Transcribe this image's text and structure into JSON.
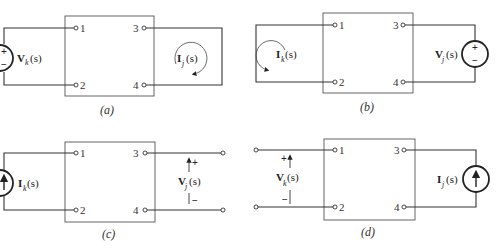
{
  "figure": {
    "panels": [
      {
        "id": "a",
        "caption": "(a)",
        "terminals": [
          "1",
          "2",
          "3",
          "4"
        ],
        "source": {
          "type": "voltage-source",
          "label_main": "V",
          "label_sub": "k",
          "label_arg": "(s)",
          "polarity": [
            "+",
            "−"
          ],
          "side": "left"
        },
        "response": {
          "type": "loop-current",
          "label_main": "I",
          "label_sub": "j",
          "label_arg": "(s)",
          "direction": "clockwise",
          "side": "right"
        }
      },
      {
        "id": "b",
        "caption": "(b)",
        "terminals": [
          "1",
          "2",
          "3",
          "4"
        ],
        "source": {
          "type": "voltage-source",
          "label_main": "V",
          "label_sub": "j",
          "label_arg": "(s)",
          "polarity": [
            "+",
            "−"
          ],
          "side": "right"
        },
        "response": {
          "type": "loop-current",
          "label_main": "I",
          "label_sub": "k",
          "label_arg": "(s)",
          "direction": "counterclockwise",
          "side": "left"
        }
      },
      {
        "id": "c",
        "caption": "(c)",
        "terminals": [
          "1",
          "2",
          "3",
          "4"
        ],
        "source": {
          "type": "current-source",
          "label_main": "I",
          "label_sub": "k",
          "label_arg": "(s)",
          "side": "left"
        },
        "response": {
          "type": "open-circuit-voltage",
          "label_main": "V",
          "label_sub": "j",
          "label_arg": "(s)",
          "polarity": [
            "+",
            "−"
          ],
          "side": "right"
        }
      },
      {
        "id": "d",
        "caption": "(d)",
        "terminals": [
          "1",
          "2",
          "3",
          "4"
        ],
        "source": {
          "type": "current-source",
          "label_main": "I",
          "label_sub": "j",
          "label_arg": "(s)",
          "side": "right"
        },
        "response": {
          "type": "open-circuit-voltage",
          "label_main": "V",
          "label_sub": "k",
          "label_arg": "(s)",
          "polarity": [
            "+",
            "−"
          ],
          "side": "left"
        }
      }
    ]
  }
}
